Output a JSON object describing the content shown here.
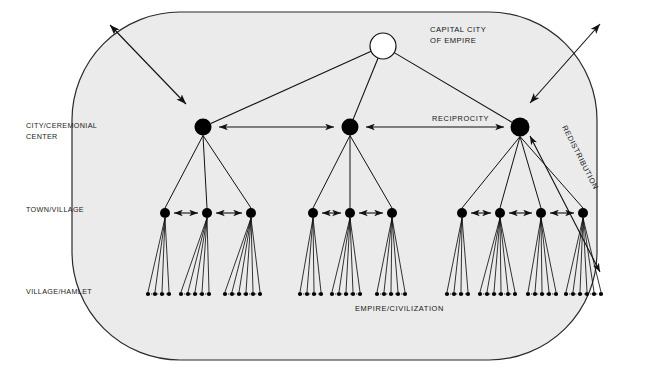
{
  "figure": {
    "kind": "settlement-hierarchy-diagram",
    "background_color": "#ffffff",
    "boundary_fill": "#ebebeb",
    "boundary_stroke": "#2b2b2b",
    "line_color": "#111111",
    "node_fill": "#000000",
    "capital_fill": "#ffffff"
  },
  "tier_labels": [
    {
      "id": "tier-city",
      "line1": "CITY/CEREMONIAL",
      "line2": "CENTER",
      "x": 26,
      "y": 128
    },
    {
      "id": "tier-town",
      "line1": "TOWN/VILLAGE",
      "line2": "",
      "x": 26,
      "y": 212
    },
    {
      "id": "tier-hamlet",
      "line1": "VILLAGE/HAMLET",
      "line2": "",
      "x": 26,
      "y": 294
    }
  ],
  "node_labels": [
    {
      "id": "capital-label",
      "line1": "CAPITAL CITY",
      "line2": "OF  EMPIRE",
      "x": 430,
      "y": 32
    }
  ],
  "flow_labels": [
    {
      "id": "reciprocity-label",
      "text": "RECIPROCITY",
      "x": 432,
      "y": 121,
      "rotate": 0
    },
    {
      "id": "redistribution-label",
      "text": "REDISTRIBUTION",
      "x": 562,
      "y": 127,
      "rotate": 63
    }
  ],
  "system_labels": [
    {
      "id": "empire-label",
      "text": "EMPIRE/CIVILIZATION",
      "x": 355,
      "y": 311
    }
  ],
  "boundary": {
    "x": 72,
    "y": 12,
    "width": 525,
    "height": 348,
    "radius": 108
  },
  "capital": {
    "id": "capital-city",
    "cx": 383,
    "cy": 46,
    "r": 13
  },
  "city_nodes": [
    {
      "id": "city-left",
      "cx": 203,
      "cy": 127,
      "r": 8.5
    },
    {
      "id": "city-center",
      "cx": 350,
      "cy": 127,
      "r": 8.5
    },
    {
      "id": "city-right",
      "cx": 520,
      "cy": 127,
      "r": 9.5
    }
  ],
  "town_nodes": [
    {
      "id": "town-l1",
      "cx": 165,
      "cy": 213,
      "r": 5.0,
      "parent": "city-left"
    },
    {
      "id": "town-l2",
      "cx": 207,
      "cy": 213,
      "r": 5.0,
      "parent": "city-left"
    },
    {
      "id": "town-l3",
      "cx": 251,
      "cy": 213,
      "r": 5.0,
      "parent": "city-left"
    },
    {
      "id": "town-c1",
      "cx": 313,
      "cy": 213,
      "r": 5.0,
      "parent": "city-center"
    },
    {
      "id": "town-c2",
      "cx": 350,
      "cy": 213,
      "r": 5.0,
      "parent": "city-center"
    },
    {
      "id": "town-c3",
      "cx": 392,
      "cy": 213,
      "r": 5.0,
      "parent": "city-center"
    },
    {
      "id": "town-r1",
      "cx": 462,
      "cy": 213,
      "r": 5.0,
      "parent": "city-right"
    },
    {
      "id": "town-r2",
      "cx": 500,
      "cy": 213,
      "r": 5.0,
      "parent": "city-right"
    },
    {
      "id": "town-r3",
      "cx": 541,
      "cy": 213,
      "r": 5.0,
      "parent": "city-right"
    },
    {
      "id": "town-r4",
      "cx": 583,
      "cy": 213,
      "r": 5.0,
      "parent": "city-right"
    }
  ],
  "hamlet_groups": [
    {
      "parent": "town-l1",
      "y": 294,
      "dots": [
        148,
        155,
        162,
        169
      ]
    },
    {
      "parent": "town-l2",
      "y": 294,
      "dots": [
        181,
        188,
        195,
        202,
        209
      ]
    },
    {
      "parent": "town-l3",
      "y": 294,
      "dots": [
        225,
        232,
        239,
        246,
        253,
        260
      ]
    },
    {
      "parent": "town-c1",
      "y": 294,
      "dots": [
        300,
        307,
        314,
        321
      ]
    },
    {
      "parent": "town-c2",
      "y": 294,
      "dots": [
        332,
        339,
        346,
        353,
        360
      ]
    },
    {
      "parent": "town-c3",
      "y": 294,
      "dots": [
        377,
        384,
        391,
        398,
        405
      ]
    },
    {
      "parent": "town-r1",
      "y": 294,
      "dots": [
        447,
        454,
        461,
        468
      ]
    },
    {
      "parent": "town-r2",
      "y": 294,
      "dots": [
        480,
        487,
        494,
        501,
        508,
        515
      ]
    },
    {
      "parent": "town-r3",
      "y": 294,
      "dots": [
        528,
        535,
        542,
        549,
        556
      ]
    },
    {
      "parent": "town-r4",
      "y": 294,
      "dots": [
        566,
        573,
        580,
        587,
        594,
        601
      ]
    }
  ],
  "capital_links": [
    {
      "from": "capital-city",
      "to": "city-left"
    },
    {
      "from": "capital-city",
      "to": "city-center"
    },
    {
      "from": "capital-city",
      "to": "city-right"
    }
  ],
  "reciprocity_arrows": [
    {
      "id": "recip-city-1",
      "x1": 219,
      "y1": 127,
      "x2": 334,
      "y2": 127
    },
    {
      "id": "recip-city-2",
      "x1": 366,
      "y1": 127,
      "x2": 504,
      "y2": 127
    },
    {
      "id": "recip-town-l1",
      "x1": 174,
      "y1": 213,
      "x2": 198,
      "y2": 213
    },
    {
      "id": "recip-town-l2",
      "x1": 216,
      "y1": 213,
      "x2": 242,
      "y2": 213
    },
    {
      "id": "recip-town-c1",
      "x1": 322,
      "y1": 213,
      "x2": 341,
      "y2": 213
    },
    {
      "id": "recip-town-c2",
      "x1": 359,
      "y1": 213,
      "x2": 383,
      "y2": 213
    },
    {
      "id": "recip-town-r1",
      "x1": 471,
      "y1": 213,
      "x2": 491,
      "y2": 213
    },
    {
      "id": "recip-town-r2",
      "x1": 509,
      "y1": 213,
      "x2": 532,
      "y2": 213
    },
    {
      "id": "recip-town-r3",
      "x1": 550,
      "y1": 213,
      "x2": 574,
      "y2": 213
    }
  ],
  "redistribution_arrow": {
    "id": "redistribution-arrow",
    "x1": 530,
    "y1": 136,
    "x2": 600,
    "y2": 272
  },
  "external_arrows": [
    {
      "id": "external-arrow-left",
      "x1": 110,
      "y1": 25,
      "x2": 186,
      "y2": 104
    },
    {
      "id": "external-arrow-right",
      "x1": 530,
      "y1": 103,
      "x2": 600,
      "y2": 24
    }
  ]
}
